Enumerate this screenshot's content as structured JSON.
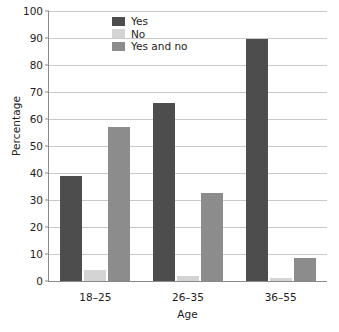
{
  "chart_data": {
    "type": "bar",
    "title": "",
    "xlabel": "Age",
    "ylabel": "Percentage",
    "categories": [
      "18–25",
      "26–35",
      "36–55"
    ],
    "series": [
      {
        "name": "Yes",
        "color": "#4d4d4d",
        "values": [
          39,
          66,
          89.5
        ]
      },
      {
        "name": "No",
        "color": "#d4d4d4",
        "values": [
          4,
          2,
          1
        ]
      },
      {
        "name": "Yes and no",
        "color": "#8c8c8c",
        "values": [
          57,
          32.5,
          8.5
        ]
      }
    ],
    "ylim": [
      0,
      100
    ],
    "yticks": [
      0,
      10,
      20,
      30,
      40,
      50,
      60,
      70,
      80,
      90,
      100
    ],
    "ytick_labels": [
      "0",
      "10",
      "20",
      "30",
      "40",
      "50",
      "60",
      "70",
      "80",
      "90",
      "100"
    ],
    "grid": true,
    "legend_position": "top-center",
    "axis_color": "#8a8a8a",
    "grid_color": "#c9c9c9",
    "background": "#ffffff"
  },
  "legend": {
    "items": [
      {
        "label": "Yes"
      },
      {
        "label": "No"
      },
      {
        "label": "Yes and no"
      }
    ]
  }
}
